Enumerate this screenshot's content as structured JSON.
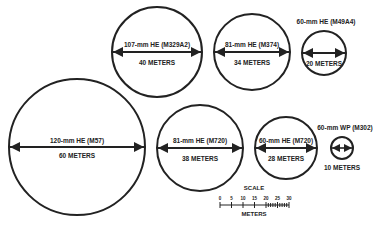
{
  "diagram": {
    "type": "bursting-radius-comparison",
    "circles": [
      {
        "id": "120mm-he-m57",
        "label": "120-mm HE (M57)",
        "diameter_label": "60 METERS",
        "diameter_m": 60,
        "cx": 77,
        "cy": 147,
        "r": 68,
        "label_pos": "inside"
      },
      {
        "id": "107mm-he-m329a2",
        "label": "107-mm HE (M329A2)",
        "diameter_label": "40 METERS",
        "diameter_m": 40,
        "cx": 157,
        "cy": 52,
        "r": 45,
        "label_pos": "inside"
      },
      {
        "id": "81mm-he-m374",
        "label": "81-mm HE (M374)",
        "diameter_label": "34 METERS",
        "diameter_m": 34,
        "cx": 252,
        "cy": 52,
        "r": 38,
        "label_pos": "inside"
      },
      {
        "id": "60mm-he-m49a4",
        "label": "60-mm HE (M49A4)",
        "diameter_label": "20 METERS",
        "diameter_m": 20,
        "cx": 324,
        "cy": 53,
        "r": 22,
        "label_pos": "above"
      },
      {
        "id": "81mm-he-m720",
        "label": "81-mm HE (M720)",
        "diameter_label": "38 METERS",
        "diameter_m": 38,
        "cx": 200,
        "cy": 148,
        "r": 43,
        "label_pos": "inside"
      },
      {
        "id": "60mm-he-m720",
        "label": "60-mm HE (M720)",
        "diameter_label": "28 METERS",
        "diameter_m": 28,
        "cx": 286,
        "cy": 148,
        "r": 31,
        "label_pos": "inside"
      },
      {
        "id": "60mm-wp-m302",
        "label": "60-mm WP (M302)",
        "diameter_label": "10 METERS",
        "diameter_m": 10,
        "cx": 342,
        "cy": 148,
        "r": 11,
        "label_pos": "above-below"
      }
    ],
    "scale": {
      "title": "SCALE",
      "unit_label": "METERS",
      "ticks": [
        "0",
        "5",
        "10",
        "15",
        "20",
        "25",
        "30"
      ]
    }
  }
}
